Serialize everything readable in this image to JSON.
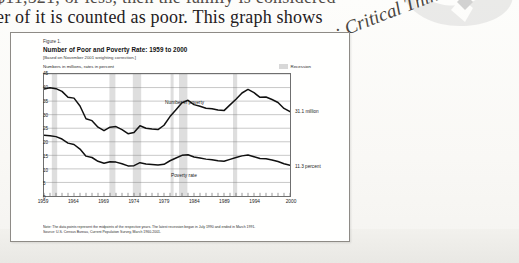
{
  "page": {
    "body_line_1": "$11,521, or less, then the family is considered",
    "body_line_2": "er of it is counted as poor. This graph shows",
    "chapter_watermark": ": Critical Thinking"
  },
  "figure": {
    "number": "Figure 1.",
    "title": "Number of Poor and Poverty Rate:  1959 to 2000",
    "subtitle": "[Based on November 2001 weighting correction.]",
    "axis_units": "Numbers in millions, rates in percent",
    "legend": {
      "label": "Recession",
      "swatch_color": "#d8d8d8"
    },
    "end_label_number": "31.1 million",
    "end_label_rate": "11.3 percent",
    "series_label_number": "Number in poverty",
    "series_label_rate": "Poverty rate",
    "notes": [
      "Note:  The data points represent the midpoints of the respective years.  The latest recession began in July 1990 and ended in March 1991.",
      "Source:  U.S. Census Bureau, Current Population Survey, March 1960-2001."
    ]
  },
  "chart_data": {
    "type": "line",
    "title": "Number of Poor and Poverty Rate:  1959 to 2000",
    "xlabel": "",
    "ylabel": "Numbers in millions, rates in percent",
    "xlim": [
      1959,
      2000
    ],
    "ylim": [
      0,
      45
    ],
    "yticks": [
      0,
      5,
      10,
      15,
      20,
      25,
      30,
      35,
      40,
      45
    ],
    "xticks": [
      1959,
      1964,
      1969,
      1974,
      1979,
      1984,
      1989,
      1994,
      2000
    ],
    "grid": true,
    "legend_position": "top-right",
    "x": [
      1959,
      1960,
      1961,
      1962,
      1963,
      1964,
      1965,
      1966,
      1967,
      1968,
      1969,
      1970,
      1971,
      1972,
      1973,
      1974,
      1975,
      1976,
      1977,
      1978,
      1979,
      1980,
      1981,
      1982,
      1983,
      1984,
      1985,
      1986,
      1987,
      1988,
      1989,
      1990,
      1991,
      1992,
      1993,
      1994,
      1995,
      1996,
      1997,
      1998,
      1999,
      2000
    ],
    "series": [
      {
        "name": "Number in poverty",
        "units": "millions",
        "values": [
          39.5,
          39.9,
          39.6,
          38.6,
          36.4,
          36.1,
          33.2,
          28.5,
          27.8,
          25.4,
          24.1,
          25.4,
          25.6,
          24.5,
          23.0,
          23.4,
          25.9,
          25.0,
          24.7,
          24.5,
          26.1,
          29.3,
          31.8,
          34.4,
          35.3,
          33.7,
          33.1,
          32.4,
          32.2,
          31.7,
          31.5,
          33.6,
          35.7,
          38.0,
          39.3,
          38.1,
          36.4,
          36.5,
          35.6,
          34.5,
          32.3,
          31.1
        ],
        "end_value_label": "31.1 million"
      },
      {
        "name": "Poverty rate",
        "units": "percent",
        "values": [
          22.4,
          22.2,
          21.9,
          21.0,
          19.5,
          19.0,
          17.3,
          14.7,
          14.2,
          12.8,
          12.1,
          12.6,
          12.5,
          11.9,
          11.1,
          11.2,
          12.3,
          11.8,
          11.6,
          11.4,
          11.7,
          13.0,
          14.0,
          15.0,
          15.2,
          14.4,
          14.0,
          13.6,
          13.4,
          13.0,
          12.8,
          13.5,
          14.2,
          14.8,
          15.1,
          14.5,
          13.8,
          13.7,
          13.3,
          12.7,
          11.9,
          11.3
        ],
        "end_value_label": "11.3 percent"
      }
    ],
    "recession_bands": [
      {
        "start": 1960.3,
        "end": 1961.2
      },
      {
        "start": 1969.9,
        "end": 1970.9
      },
      {
        "start": 1973.8,
        "end": 1975.2
      },
      {
        "start": 1980.1,
        "end": 1980.6
      },
      {
        "start": 1981.5,
        "end": 1982.9
      },
      {
        "start": 1990.5,
        "end": 1991.2
      }
    ]
  }
}
